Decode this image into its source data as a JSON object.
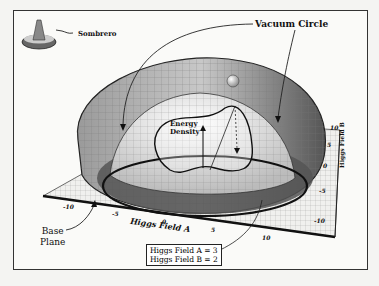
{
  "labels": {
    "sombrero": "Sombrero",
    "vacuum_circle": "Vacuum Circle",
    "energy_density_line1": "Energy",
    "energy_density_line2": "Density",
    "base_plane_line1": "Base",
    "base_plane_line2": "Plane",
    "axis_a": "Higgs Field A",
    "axis_b": "Higgs Field B"
  },
  "axis_a_ticks": [
    "-10",
    "-5",
    "0",
    "5",
    "10"
  ],
  "axis_b_ticks": [
    "10",
    "5",
    "0",
    "-5",
    "-10"
  ],
  "info_box": {
    "line1": "Higgs Field A = 3",
    "line2": "Higgs Field B = 2"
  }
}
